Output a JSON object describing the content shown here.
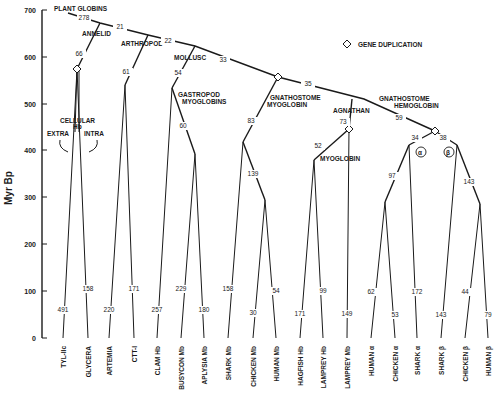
{
  "figure": {
    "y_axis_title": "Myr Bp",
    "y_ticks": [
      {
        "label": "700",
        "y": 10
      },
      {
        "label": "600",
        "y": 57
      },
      {
        "label": "500",
        "y": 104
      },
      {
        "label": "400",
        "y": 150
      },
      {
        "label": "300",
        "y": 197
      },
      {
        "label": "200",
        "y": 244
      },
      {
        "label": "100",
        "y": 291
      },
      {
        "label": "0",
        "y": 338
      }
    ],
    "legend": {
      "symbol": "diamond",
      "label": "GENE DUPLICATION"
    },
    "clade_labels": [
      {
        "id": "plant-globins",
        "text": "PLANT GLOBINS",
        "x": 54,
        "y": 11
      },
      {
        "id": "annelid",
        "text": "ANNELID",
        "x": 82,
        "y": 36
      },
      {
        "id": "arthropod",
        "text": "ARTHROPOD",
        "x": 121,
        "y": 46
      },
      {
        "id": "mollusc",
        "text": "MOLLUSC",
        "x": 174,
        "y": 60
      },
      {
        "id": "gastropod-1",
        "text": "GASTROPOD",
        "x": 178,
        "y": 97
      },
      {
        "id": "gastropod-2",
        "text": "MYOGLOBINS",
        "x": 182,
        "y": 104
      },
      {
        "id": "cellular-1",
        "text": "CELLULAR",
        "x": 60,
        "y": 123
      },
      {
        "id": "cellular-2",
        "text": "Hb",
        "x": 73,
        "y": 129
      },
      {
        "id": "extra",
        "text": "EXTRA",
        "x": 47,
        "y": 136
      },
      {
        "id": "intra",
        "text": "INTRA",
        "x": 84,
        "y": 136
      },
      {
        "id": "gm-1",
        "text": "GNATHOSTOME",
        "x": 270,
        "y": 100
      },
      {
        "id": "gm-2",
        "text": "MYOGLOBIN",
        "x": 267,
        "y": 107
      },
      {
        "id": "agnathan",
        "text": "AGNATHAN",
        "x": 333,
        "y": 113
      },
      {
        "id": "gh-1",
        "text": "GNATHOSTOME",
        "x": 379,
        "y": 101
      },
      {
        "id": "gh-2",
        "text": "HEMOGLOBIN",
        "x": 394,
        "y": 108
      },
      {
        "id": "myoglobin",
        "text": "MYOGLOBIN",
        "x": 320,
        "y": 161
      },
      {
        "id": "alpha",
        "text": "α",
        "x": 420,
        "y": 155
      },
      {
        "id": "beta",
        "text": "β",
        "x": 448,
        "y": 155
      }
    ],
    "branch_numbers": [
      {
        "text": "278",
        "x": 84,
        "y": 20
      },
      {
        "text": "21",
        "x": 120,
        "y": 29
      },
      {
        "text": "22",
        "x": 168,
        "y": 43
      },
      {
        "text": "33",
        "x": 223,
        "y": 62
      },
      {
        "text": "35",
        "x": 308,
        "y": 86
      },
      {
        "text": "59",
        "x": 399,
        "y": 120
      },
      {
        "text": "66",
        "x": 79,
        "y": 56
      },
      {
        "text": "61",
        "x": 126,
        "y": 74
      },
      {
        "text": "54",
        "x": 178,
        "y": 75
      },
      {
        "text": "60",
        "x": 183,
        "y": 128
      },
      {
        "text": "83",
        "x": 251,
        "y": 123
      },
      {
        "text": "139",
        "x": 253,
        "y": 176
      },
      {
        "text": "73",
        "x": 343,
        "y": 124
      },
      {
        "text": "52",
        "x": 318,
        "y": 148
      },
      {
        "text": "34",
        "x": 415,
        "y": 140
      },
      {
        "text": "38",
        "x": 443,
        "y": 140
      },
      {
        "text": "97",
        "x": 392,
        "y": 178
      },
      {
        "text": "143",
        "x": 469,
        "y": 184
      }
    ],
    "leaves": [
      {
        "name": "TYL-IIc",
        "num": "491",
        "num_y": 312,
        "x": 63
      },
      {
        "name": "GLYCERA",
        "num": "158",
        "num_y": 291,
        "x": 88
      },
      {
        "name": "ARTEMIA",
        "num": "220",
        "num_y": 312,
        "x": 109
      },
      {
        "name": "CTT-I",
        "num": "171",
        "num_y": 291,
        "x": 134
      },
      {
        "name": "CLAM Hb",
        "num": "257",
        "num_y": 312,
        "x": 157
      },
      {
        "name": "BUSYCON Mb",
        "num": "229",
        "num_y": 291,
        "x": 181
      },
      {
        "name": "APLYSIA Mb",
        "num": "180",
        "num_y": 312,
        "x": 204
      },
      {
        "name": "SHARK Mb",
        "num": "158",
        "num_y": 291,
        "x": 228
      },
      {
        "name": "CHICKEN Mb",
        "num": "30",
        "num_y": 315,
        "x": 253
      },
      {
        "name": "HUMAN Mb",
        "num": "54",
        "num_y": 293,
        "x": 276
      },
      {
        "name": "HAGFISH Hb",
        "num": "171",
        "num_y": 316,
        "x": 300
      },
      {
        "name": "LAMPREY Hb",
        "num": "99",
        "num_y": 293,
        "x": 323
      },
      {
        "name": "LAMPREY Mb",
        "num": "149",
        "num_y": 316,
        "x": 347
      },
      {
        "name": "HUMAN α",
        "num": "62",
        "num_y": 294,
        "x": 371
      },
      {
        "name": "CHICKEN α",
        "num": "53",
        "num_y": 317,
        "x": 395
      },
      {
        "name": "SHARK α",
        "num": "172",
        "num_y": 294,
        "x": 417
      },
      {
        "name": "SHARK β",
        "num": "143",
        "num_y": 317,
        "x": 441
      },
      {
        "name": "CHICKEN β",
        "num": "44",
        "num_y": 294,
        "x": 465
      },
      {
        "name": "HUMAN β",
        "num": "79",
        "num_y": 317,
        "x": 488
      }
    ]
  }
}
